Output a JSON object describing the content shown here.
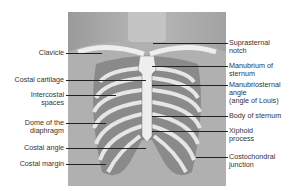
{
  "figure": {
    "left_labels": [
      {
        "text": "Clavicle",
        "y": 53
      },
      {
        "text": "Costal cartilage",
        "y": 80
      },
      {
        "text": "Intercostal\nspaces",
        "y": 95
      },
      {
        "text": "Dome of the\ndiaphragm",
        "y": 123
      },
      {
        "text": "Costal angle",
        "y": 148
      },
      {
        "text": "Costal margin",
        "y": 164
      }
    ],
    "right_labels": [
      {
        "text": "Suprasternal\nnotch",
        "y": 43
      },
      {
        "text": "Manubrium of\nsternum",
        "y": 66
      },
      {
        "text": "Manubriosternal\nangle\n(angle of Louis)",
        "y": 85
      },
      {
        "text": "Body of sternum",
        "y": 116
      },
      {
        "text": "Xiphoid\nprocess",
        "y": 131
      },
      {
        "text": "Costochondral\njunction",
        "y": 157
      }
    ]
  }
}
